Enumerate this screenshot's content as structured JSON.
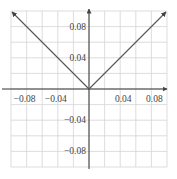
{
  "chart_data": {
    "type": "line",
    "title": "",
    "xlabel": "",
    "ylabel": "",
    "xlim": [
      -0.1,
      0.1
    ],
    "ylim": [
      -0.1,
      0.1
    ],
    "grid": true,
    "grid_step": 0.02,
    "x_ticks": [
      {
        "value": -0.08,
        "label": "−0.08"
      },
      {
        "value": -0.04,
        "label": "−0.04"
      },
      {
        "value": 0.04,
        "label": "0.04"
      },
      {
        "value": 0.08,
        "label": "0.08"
      }
    ],
    "y_ticks": [
      {
        "value": 0.08,
        "label": "0.08"
      },
      {
        "value": 0.04,
        "label": "0.04"
      },
      {
        "value": -0.04,
        "label": "−0.04"
      },
      {
        "value": -0.08,
        "label": "−0.08"
      }
    ],
    "series": [
      {
        "name": "y = |x|",
        "x": [
          -0.1,
          0,
          0.1
        ],
        "y": [
          0.1,
          0,
          0.1
        ],
        "arrows": "both-ends"
      }
    ]
  },
  "colors": {
    "grid": "#d4d4d4",
    "axis": "#333333",
    "line": "#555555",
    "tick_text": "#444444"
  }
}
